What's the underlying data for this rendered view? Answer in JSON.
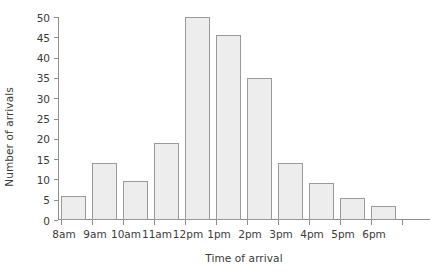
{
  "chart_data": {
    "type": "bar",
    "title": "",
    "subtitle": "",
    "xlabel": "Time of arrival",
    "ylabel": "Number of arrivals",
    "categories": [
      "8am",
      "9am",
      "10am",
      "11am",
      "12pm",
      "1pm",
      "2pm",
      "3pm",
      "4pm",
      "5pm",
      "6pm"
    ],
    "values": [
      6,
      14,
      9.5,
      19,
      50,
      45.5,
      35,
      14,
      9,
      5.5,
      3.5
    ],
    "series": [
      {
        "name": "Number of arrivals",
        "values": [
          6,
          14,
          9.5,
          19,
          50,
          45.5,
          35,
          14,
          9,
          5.5,
          3.5
        ]
      }
    ],
    "ylim": [
      0,
      50
    ],
    "yticks": [
      0,
      5,
      10,
      15,
      20,
      25,
      30,
      35,
      40,
      45,
      50
    ],
    "ytick_labels": [
      "0",
      "5",
      "10",
      "15",
      "20",
      "25",
      "30",
      "35",
      "40",
      "45",
      "50"
    ],
    "xtick_labels": [
      "8am",
      "9am",
      "10am",
      "11am",
      "12pm",
      "1pm",
      "2pm",
      "3pm",
      "4pm",
      "5pm",
      "6pm"
    ],
    "grid": false,
    "legend": null,
    "legend_position": "none",
    "bar_fill_color": "#ededed",
    "bar_edge_color": "#9a9a9a",
    "axis_color": "#8e8e8e",
    "text_color": "#3a3a3a",
    "background_color": "#ffffff",
    "annotations": []
  }
}
